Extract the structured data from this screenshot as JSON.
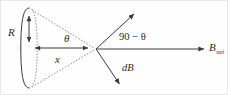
{
  "figure": {
    "kind": "physics-vector-diagram",
    "background_color": "#fefefe",
    "border_color": "#e8e8e8",
    "stroke_color": "#3a3a3a",
    "dotted_color": "#7d7d7d"
  },
  "labels": {
    "radius": "R",
    "angle_theta": "θ",
    "axial_distance": "x",
    "complement_angle": "90 − θ",
    "field_element": "dB",
    "net_field_base": "B",
    "net_field_sub": "net"
  },
  "geometry": {
    "loop_ellipse": {
      "cx": 28,
      "cy": 47,
      "rx": 8,
      "ry": 40
    },
    "radius_arrow": {
      "x": 28,
      "y1": 14,
      "y2": 42,
      "double_headed": true
    },
    "axis_arrow": {
      "x1": 33,
      "x2": 88,
      "y": 47,
      "double_headed": true
    },
    "vertex": {
      "x": 95,
      "y": 48
    },
    "dotted_upper_ray": {
      "x1": 30,
      "y1": 9,
      "x2": 95,
      "y2": 48
    },
    "dotted_lower_ray": {
      "x1": 30,
      "y1": 86,
      "x2": 95,
      "y2": 48
    },
    "dB_arrow_up": {
      "x1": 95,
      "y1": 48,
      "x2": 135,
      "y2": 11,
      "arrowhead": "end"
    },
    "dB_arrow_down": {
      "x1": 95,
      "y1": 48,
      "x2": 120,
      "y2": 85,
      "arrowhead": "end"
    },
    "bnet_arrow": {
      "x1": 95,
      "y1": 48,
      "x2": 205,
      "y2": 48,
      "arrowhead": "end"
    }
  }
}
